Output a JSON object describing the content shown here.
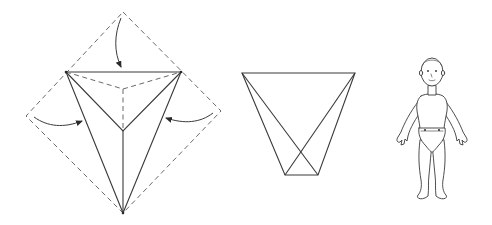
{
  "figure": {
    "panels": [
      {
        "id": "step-1",
        "label": "Square cloth folded into triangle with three fold arrows"
      },
      {
        "id": "step-2",
        "label": "Folded diaper trapezoid shape"
      },
      {
        "id": "step-3",
        "label": "Baby wearing diaper"
      }
    ]
  },
  "colors": {
    "line": "#3a3a3a",
    "dashed": "#6a6a6a",
    "background": "#ffffff"
  }
}
